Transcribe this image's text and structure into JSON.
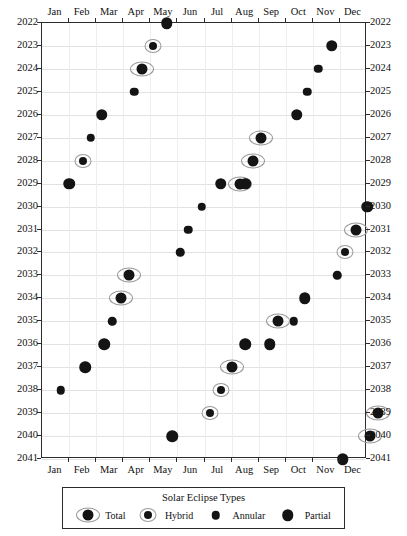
{
  "chart_data": {
    "type": "scatter",
    "title": "",
    "xlabel": "",
    "ylabel": "",
    "legend_title": "Solar Eclipse Types",
    "legend_position": "bottom",
    "grid": true,
    "x_categories": [
      "Jan",
      "Feb",
      "Mar",
      "Apr",
      "May",
      "Jun",
      "Jul",
      "Aug",
      "Sep",
      "Oct",
      "Nov",
      "Dec"
    ],
    "y_categories": [
      2022,
      2023,
      2024,
      2025,
      2026,
      2027,
      2028,
      2029,
      2030,
      2031,
      2032,
      2033,
      2034,
      2035,
      2036,
      2037,
      2038,
      2039,
      2040,
      2041
    ],
    "ylim": [
      2022,
      2041
    ],
    "y_axis_inverted": true,
    "series": [
      {
        "name": "Total",
        "marker": "large-dot-wide-ring"
      },
      {
        "name": "Hybrid",
        "marker": "small-dot-ring"
      },
      {
        "name": "Annular",
        "marker": "small-dot"
      },
      {
        "name": "Partial",
        "marker": "large-dot"
      }
    ],
    "points": [
      {
        "year": 2022,
        "month": 4.1,
        "type": "Partial"
      },
      {
        "year": 2023,
        "month": 3.6,
        "type": "Hybrid"
      },
      {
        "year": 2023,
        "month": 10.2,
        "type": "Partial"
      },
      {
        "year": 2024,
        "month": 3.2,
        "type": "Total"
      },
      {
        "year": 2024,
        "month": 9.7,
        "type": "Annular"
      },
      {
        "year": 2025,
        "month": 2.9,
        "type": "Annular"
      },
      {
        "year": 2025,
        "month": 9.3,
        "type": "Annular"
      },
      {
        "year": 2026,
        "month": 1.7,
        "type": "Partial"
      },
      {
        "year": 2026,
        "month": 8.9,
        "type": "Partial"
      },
      {
        "year": 2027,
        "month": 1.3,
        "type": "Annular"
      },
      {
        "year": 2027,
        "month": 7.6,
        "type": "Total"
      },
      {
        "year": 2028,
        "month": 1.0,
        "type": "Hybrid"
      },
      {
        "year": 2028,
        "month": 7.3,
        "type": "Total"
      },
      {
        "year": 2029,
        "month": 0.5,
        "type": "Partial"
      },
      {
        "year": 2029,
        "month": 6.8,
        "type": "Total"
      },
      {
        "year": 2029,
        "month": 6.1,
        "type": "Partial"
      },
      {
        "year": 2029,
        "month": 7.0,
        "type": "Partial"
      },
      {
        "year": 2030,
        "month": 5.4,
        "type": "Annular"
      },
      {
        "year": 2030,
        "month": 11.5,
        "type": "Partial"
      },
      {
        "year": 2031,
        "month": 4.9,
        "type": "Annular"
      },
      {
        "year": 2031,
        "month": 11.1,
        "type": "Total"
      },
      {
        "year": 2032,
        "month": 4.6,
        "type": "Annular"
      },
      {
        "year": 2032,
        "month": 10.7,
        "type": "Hybrid"
      },
      {
        "year": 2033,
        "month": 2.7,
        "type": "Total"
      },
      {
        "year": 2033,
        "month": 10.4,
        "type": "Annular"
      },
      {
        "year": 2034,
        "month": 2.4,
        "type": "Total"
      },
      {
        "year": 2034,
        "month": 9.2,
        "type": "Partial"
      },
      {
        "year": 2035,
        "month": 2.1,
        "type": "Annular"
      },
      {
        "year": 2035,
        "month": 8.8,
        "type": "Annular"
      },
      {
        "year": 2035,
        "month": 8.2,
        "type": "Total"
      },
      {
        "year": 2036,
        "month": 1.8,
        "type": "Partial"
      },
      {
        "year": 2036,
        "month": 7.0,
        "type": "Partial"
      },
      {
        "year": 2036,
        "month": 7.9,
        "type": "Partial"
      },
      {
        "year": 2037,
        "month": 1.1,
        "type": "Partial"
      },
      {
        "year": 2037,
        "month": 6.5,
        "type": "Total"
      },
      {
        "year": 2038,
        "month": 0.2,
        "type": "Annular"
      },
      {
        "year": 2038,
        "month": 6.1,
        "type": "Hybrid"
      },
      {
        "year": 2039,
        "month": 5.7,
        "type": "Hybrid"
      },
      {
        "year": 2039,
        "month": 11.9,
        "type": "Total"
      },
      {
        "year": 2040,
        "month": 4.3,
        "type": "Partial"
      },
      {
        "year": 2040,
        "month": 11.6,
        "type": "Total"
      },
      {
        "year": 2041,
        "month": 10.6,
        "type": "Partial"
      }
    ]
  },
  "legend": {
    "title": "Solar Eclipse Types",
    "items": [
      {
        "label": "Total",
        "type": "Total"
      },
      {
        "label": "Hybrid",
        "type": "Hybrid"
      },
      {
        "label": "Annular",
        "type": "Annular"
      },
      {
        "label": "Partial",
        "type": "Partial"
      }
    ]
  },
  "colors": {
    "marker": "#141414",
    "ring": "#9a9a9a",
    "axis": "#2b2b2b",
    "grid": "#e2e2e2",
    "background": "#ffffff"
  }
}
